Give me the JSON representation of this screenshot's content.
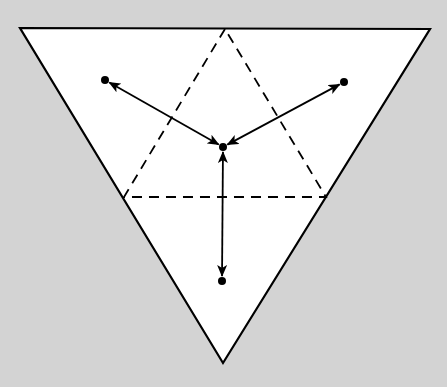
{
  "diagram": {
    "type": "geometric-figure",
    "colors": {
      "background": "#d3d3d3",
      "fill": "#ffffff",
      "stroke": "#000000"
    },
    "outer_triangle": {
      "style": "solid",
      "vertices": [
        [
          20,
          28
        ],
        [
          430,
          29
        ],
        [
          223,
          363
        ]
      ]
    },
    "inner_triangle": {
      "style": "dashed",
      "vertices": [
        [
          225,
          29
        ],
        [
          124,
          197
        ],
        [
          326,
          197
        ]
      ]
    },
    "points": [
      {
        "id": "center",
        "x": 223,
        "y": 147
      },
      {
        "id": "upper-left",
        "x": 105,
        "y": 80
      },
      {
        "id": "upper-right",
        "x": 344,
        "y": 82
      },
      {
        "id": "bottom",
        "x": 222,
        "y": 281
      }
    ],
    "arrows": [
      {
        "from": "center",
        "to": "upper-left",
        "heads": "both"
      },
      {
        "from": "center",
        "to": "upper-right",
        "heads": "both"
      },
      {
        "from": "center",
        "to": "bottom",
        "heads": "both"
      }
    ],
    "labels": []
  }
}
